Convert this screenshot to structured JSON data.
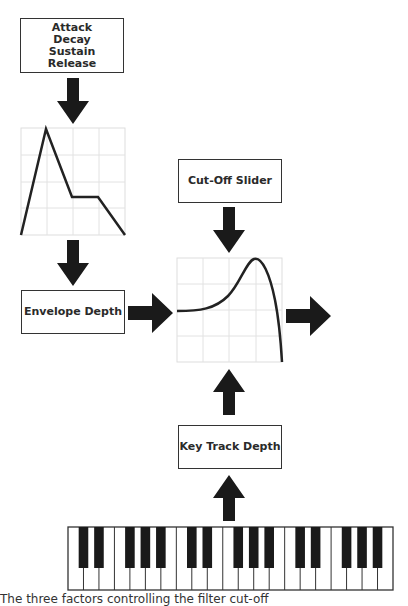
{
  "boxes": {
    "adsr": [
      "Attack",
      "Decay",
      "Sustain",
      "Release"
    ],
    "envelope_depth": "Envelope Depth",
    "cutoff_slider": "Cut-Off Slider",
    "key_track_depth": "Key Track Depth"
  },
  "graphs": {
    "adsr_envelope": {
      "stages": [
        "attack",
        "decay",
        "sustain",
        "release"
      ]
    },
    "filter_response": {
      "shape": "resonant low-pass peak"
    }
  },
  "keyboard": {
    "white_keys": 21,
    "octaves": 3,
    "start_note": "C"
  },
  "caption": "The three factors controlling the filter cut-off",
  "colors": {
    "line": "#222222",
    "grid": "#dddddd",
    "arrow": "#1a1a1a",
    "border": "#333333"
  }
}
